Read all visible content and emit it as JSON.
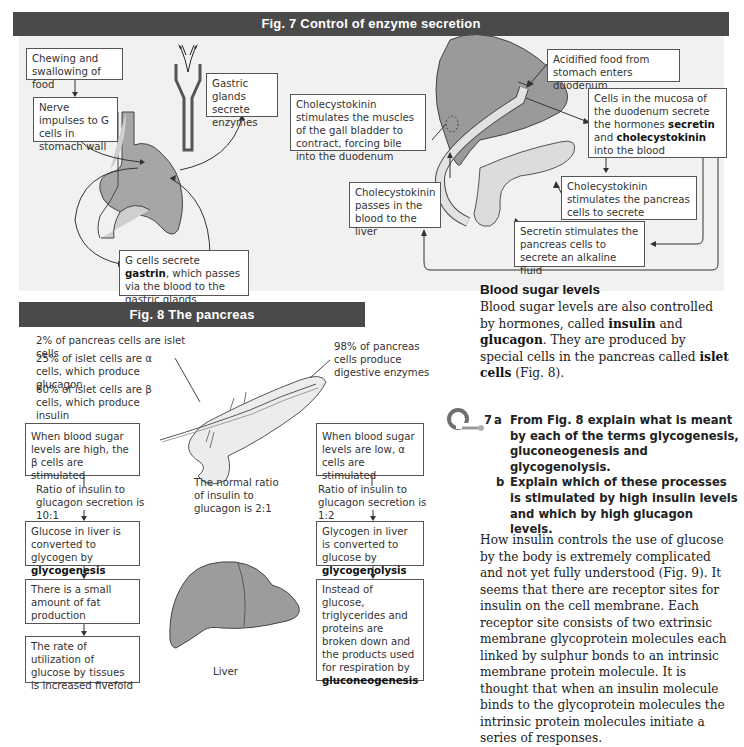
{
  "fig7": {
    "title": "Fig. 7  Control of enzyme secretion",
    "boxes": {
      "chewing": "Chewing and swallowing of food",
      "nerve": "Nerve impulses to G cells in stomach wall",
      "gastric": "Gastric glands secrete enzymes",
      "gcells_pre": "G cells secrete ",
      "gcells_bold": "gastrin",
      "gcells_post": ", which passes via the blood to the gastric glands",
      "cck_gall": "Cholecystokinin stimulates the muscles of the gall bladder to contract, forcing bile into the duodenum",
      "acidified": "Acidified food from stomach enters duodenum",
      "mucosa_pre": "Cells in the mucosa of the duodenum secrete the hormones ",
      "mucosa_bold1": "secretin",
      "mucosa_mid": " and ",
      "mucosa_bold2": "cholecystokinin",
      "mucosa_post": " into the blood",
      "cck_liver": "Cholecystokinin passes in the blood to the liver",
      "cck_pancreas": "Cholecystokinin stimulates the pancreas cells to secrete enzymes",
      "secretin": "Secretin stimulates  the pancreas cells to secrete an alkaline fluid"
    }
  },
  "fig8": {
    "title": "Fig. 8  The pancreas",
    "facts": {
      "islet": "2% of pancreas cells are islet cells",
      "alpha": "25% of islet cells are α cells, which produce glucagon",
      "beta": "60% of islet cells are β cells, which produce insulin",
      "digestive": "98% of pancreas cells produce digestive enzymes",
      "normal_ratio": "The normal ratio of insulin to glucagon is 2:1",
      "liver_label": "Liver"
    },
    "left_flow": {
      "high": "When blood sugar levels are high, the β cells are stimulated",
      "ratio": "Ratio of insulin to glucagon secretion is 10:1",
      "glucose_pre": "Glucose in liver is converted to glycogen by ",
      "glucose_bold": "glycogenesis",
      "fat": "There is a small amount of fat production",
      "rate": "The rate of utilization of glucose by tissues is increased fivefold"
    },
    "right_flow": {
      "low": "When blood sugar levels are low, α cells are stimulated",
      "ratio": "Ratio of insulin to glucagon secretion is 1:2",
      "glycogen_pre": "Glycogen in liver is converted to glucose by ",
      "glycogen_bold": "glycogenolysis",
      "instead_pre": "Instead of glucose, triglycerides and proteins are broken down and the products used for respiration by ",
      "instead_bold": "gluconeogenesis"
    }
  },
  "text": {
    "heading": "Blood sugar levels",
    "p1_a": "Blood sugar levels are also controlled by hormones, called ",
    "p1_insulin": "insulin",
    "p1_and": " and ",
    "p1_glucagon": "glucagon",
    "p1_b": ". They are produced by special cells in the pancreas called ",
    "p1_islet": "islet cells",
    "p1_c": " (Fig. 8).",
    "question_num": "7",
    "q_a_label": "a",
    "q_a": "From Fig. 8 explain what is meant by each of the terms glycogenesis, gluconeogenesis and glycogenolysis.",
    "q_b_label": "b",
    "q_b": "Explain which of these processes is stimulated by high insulin levels and which by high glucagon levels.",
    "p2": "How insulin controls the use of glucose by the body is extremely complicated and not yet fully understood (Fig. 9). It seems that there are receptor sites for insulin on the cell membrane. Each receptor site consists of two extrinsic membrane glycoprotein molecules each linked by sulphur bonds to an intrinsic membrane protein molecule. It is thought that when an insulin molecule binds to the glycoprotein molecules the intrinsic protein molecules initiate a series of responses."
  },
  "colors": {
    "title_bar": "#4a4a4a",
    "panel_bg": "#f1f1ef",
    "organ_fill": "#9a9a9a",
    "light_fill": "#e6e6e6",
    "question_icon": "#7a7a7a"
  }
}
